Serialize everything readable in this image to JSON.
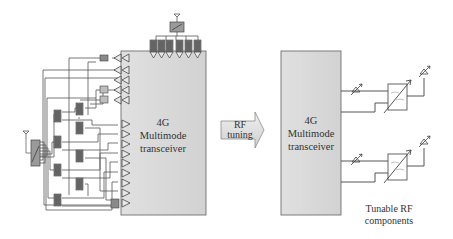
{
  "diagram": {
    "left": {
      "transceiver": {
        "line1": "4G",
        "line2": "Multimode",
        "line3": "transceiver"
      },
      "components": {
        "top_filter_count": 6,
        "tx_amplifier_count": 5,
        "rx_amplifier_count": 9,
        "side_filter_count": 9
      }
    },
    "arrow": {
      "line1": "RF",
      "line2": "tuning"
    },
    "right": {
      "transceiver": {
        "line1": "4G",
        "line2": "Multimode",
        "line3": "transceiver"
      },
      "caption": {
        "line1": "Tunable RF",
        "line2": "components"
      }
    },
    "colors": {
      "box_fill": "#d9d9d9",
      "box_stroke": "#6f6f6f",
      "line": "#4a4a4a",
      "filter_fill": "#8a8a8a",
      "arrow_fill": "#dcdcdc",
      "text": "#333333"
    }
  }
}
